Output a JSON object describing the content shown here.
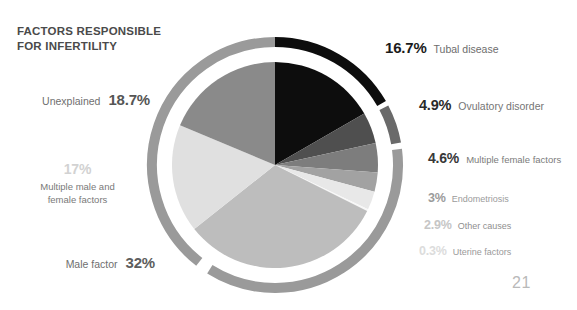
{
  "title": {
    "line1": "FACTORS RESPONSIBLE",
    "line2": "FOR INFERTILITY"
  },
  "page_number": "21",
  "labels": {
    "tubal": {
      "pct": "16.7%",
      "name": "Tubal disease"
    },
    "ovulatory": {
      "pct": "4.9%",
      "name": "Ovulatory disorder"
    },
    "multfemale": {
      "pct": "4.6%",
      "name": "Multiple female factors"
    },
    "endometriosis": {
      "pct": "3%",
      "name": "Endometriosis"
    },
    "other": {
      "pct": "2.9%",
      "name": "Other causes"
    },
    "uterine": {
      "pct": "0.3%",
      "name": "Uterine factors"
    },
    "unexplained": {
      "pct": "18.7%",
      "name": "Unexplained"
    },
    "multmalefemale": {
      "pct": "17%",
      "name_line1": "Multiple male and",
      "name_line2": "female factors"
    },
    "male": {
      "pct": "32%",
      "name": "Male factor"
    }
  },
  "chart_data": {
    "type": "pie",
    "title": "FACTORS RESPONSIBLE FOR INFERTILITY",
    "unit": "percent",
    "start_angle_deg": 0,
    "direction": "clockwise",
    "legend_position": "outside-labels",
    "grid": false,
    "has_outer_ring": true,
    "categories": [
      "Tubal disease",
      "Ovulatory disorder",
      "Multiple female factors",
      "Endometriosis",
      "Other causes",
      "Uterine factors",
      "Male factor",
      "Multiple male and female factors",
      "Unexplained"
    ],
    "values": [
      16.7,
      4.9,
      4.6,
      3,
      2.9,
      0.3,
      32,
      17,
      18.7
    ],
    "labels_shown": [
      "16.7%",
      "4.9%",
      "4.6%",
      "3%",
      "2.9%",
      "0.3%",
      "32%",
      "17%",
      "18.7%"
    ],
    "colors": [
      "#0d0d0d",
      "#4f4f4f",
      "#7d7d7d",
      "#a2a2a2",
      "#e8e8e8",
      "#f7f7f7",
      "#bdbdbd",
      "#e0e0e0",
      "#8a8a8a"
    ],
    "ring": {
      "color": "#9a9a9a",
      "tubal_segment_color": "#0d0d0d",
      "ovulatory_segment_color": "#6a6a6a",
      "gap_color": "#ffffff"
    },
    "total": 100.1
  },
  "geometry": {
    "center_x": 133,
    "center_y": 157,
    "pie_radius": 103,
    "ring_inner_radius": 118,
    "ring_outer_radius": 128
  }
}
